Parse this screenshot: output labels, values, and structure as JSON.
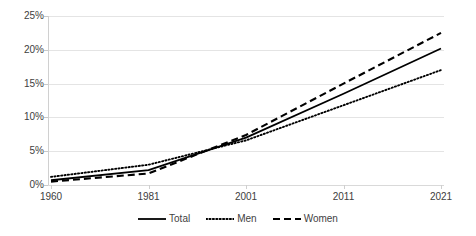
{
  "chart_data": {
    "type": "line",
    "title": "",
    "subtitle": "",
    "xlabel": "",
    "ylabel": "",
    "categories": [
      "1960",
      "1981",
      "2001",
      "2011",
      "2021"
    ],
    "series": [
      {
        "name": "Total",
        "style": "solid",
        "values": [
          0.7,
          2.2,
          7.0,
          13.5,
          20.2
        ]
      },
      {
        "name": "Men",
        "style": "dotted",
        "values": [
          1.2,
          3.0,
          6.6,
          11.8,
          17.0
        ]
      },
      {
        "name": "Women",
        "style": "dashed",
        "values": [
          0.5,
          1.7,
          7.4,
          15.0,
          22.5
        ]
      }
    ],
    "ylim": [
      0,
      25
    ],
    "y_ticks": [
      "0%",
      "5%",
      "10%",
      "15%",
      "20%",
      "25%"
    ],
    "y_tick_values": [
      0,
      5,
      10,
      15,
      20,
      25
    ],
    "grid": true,
    "legend_position": "bottom",
    "colors": {
      "series": "#000000",
      "gridline": "#e4e4e4",
      "axis": "#d0d0d0",
      "text": "#404040",
      "background": "#ffffff"
    }
  },
  "axes": {
    "y_labels": [
      "25%",
      "20%",
      "15%",
      "10%",
      "5%",
      "0%"
    ],
    "x_labels": [
      "1960",
      "1981",
      "2001",
      "2011",
      "2021"
    ]
  },
  "legend": {
    "items": [
      {
        "label": "Total",
        "style": "solid"
      },
      {
        "label": "Men",
        "style": "dotted"
      },
      {
        "label": "Women",
        "style": "dashed"
      }
    ]
  }
}
